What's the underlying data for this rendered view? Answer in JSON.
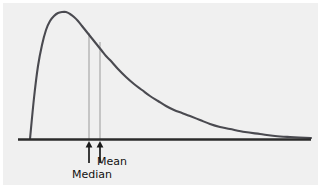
{
  "figure": {
    "name": "skewed-distribution-mean-median-diagram",
    "background_color": "#ffffff",
    "plot_background_color": "#f0f0f0",
    "curve_color": "#4a4a50",
    "baseline_color": "#2b2b2b",
    "guide_line_color": "#9a9a9a",
    "arrow_color": "#1a1a1a",
    "text_color": "#111111"
  },
  "labels": {
    "mean": "Mean",
    "median": "Median"
  },
  "chart_data": {
    "type": "line",
    "title": "",
    "subtitle": "",
    "xlabel": "",
    "ylabel": "",
    "grid": false,
    "legend": "none",
    "xlim": [
      0,
      321
    ],
    "ylim": [
      0,
      194
    ],
    "baseline_y": 139,
    "curve_start_x": 30,
    "curve_end_x": 311,
    "peak": {
      "x": 62,
      "y": 12
    },
    "annotations": [
      {
        "label": "Median",
        "x": 89,
        "line_top_y": 33,
        "line_bottom_y": 139,
        "arrow_tip_y": 142,
        "arrow_tail_y": 163,
        "label_x": 72,
        "label_y": 169
      },
      {
        "label": "Mean",
        "x": 100,
        "line_top_y": 42,
        "line_bottom_y": 139,
        "arrow_tip_y": 142,
        "arrow_tail_y": 163,
        "label_x": 97,
        "label_y": 156
      }
    ],
    "x": [
      30,
      34,
      38,
      42,
      46,
      50,
      54,
      58,
      62,
      66,
      70,
      74,
      78,
      82,
      86,
      90,
      94,
      98,
      102,
      106,
      110,
      118,
      126,
      134,
      142,
      150,
      158,
      166,
      174,
      182,
      190,
      200,
      210,
      220,
      230,
      245,
      260,
      275,
      290,
      311
    ],
    "y": [
      139,
      98,
      66,
      45,
      30,
      21,
      16,
      13,
      12,
      12,
      14,
      17,
      21,
      26,
      31,
      36,
      41,
      46,
      51,
      56,
      60,
      69,
      77,
      84,
      90,
      96,
      101,
      106,
      110,
      113,
      116,
      120,
      124,
      127,
      129,
      132,
      134,
      136,
      137,
      138
    ]
  }
}
